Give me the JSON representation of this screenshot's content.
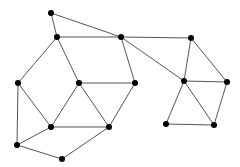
{
  "graph": {
    "nodes": [
      {
        "id": "n1"
      },
      {
        "id": "n2"
      },
      {
        "id": "n3"
      },
      {
        "id": "n4"
      },
      {
        "id": "n5"
      },
      {
        "id": "n6"
      },
      {
        "id": "n7"
      },
      {
        "id": "n8"
      },
      {
        "id": "n9"
      },
      {
        "id": "n10"
      },
      {
        "id": "n11"
      },
      {
        "id": "n12"
      },
      {
        "id": "n13"
      },
      {
        "id": "n14"
      },
      {
        "id": "n15"
      }
    ],
    "edges": [
      [
        "n1",
        "n2"
      ],
      [
        "n1",
        "n3"
      ],
      [
        "n2",
        "n3"
      ],
      [
        "n2",
        "n5"
      ],
      [
        "n2",
        "n6"
      ],
      [
        "n3",
        "n4"
      ],
      [
        "n3",
        "n7"
      ],
      [
        "n3",
        "n8"
      ],
      [
        "n4",
        "n8"
      ],
      [
        "n4",
        "n9"
      ],
      [
        "n6",
        "n7"
      ],
      [
        "n6",
        "n10"
      ],
      [
        "n6",
        "n11"
      ],
      [
        "n7",
        "n11"
      ],
      [
        "n5",
        "n10"
      ],
      [
        "n5",
        "n12"
      ],
      [
        "n10",
        "n11"
      ],
      [
        "n10",
        "n12"
      ],
      [
        "n12",
        "n13"
      ],
      [
        "n13",
        "n11"
      ],
      [
        "n8",
        "n9"
      ],
      [
        "n8",
        "n14"
      ],
      [
        "n8",
        "n15"
      ],
      [
        "n9",
        "n15"
      ],
      [
        "n14",
        "n15"
      ]
    ],
    "node_color": "#000000",
    "edge_color": "#555555"
  }
}
